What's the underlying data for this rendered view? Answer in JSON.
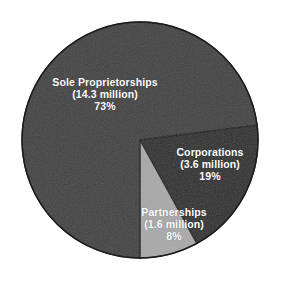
{
  "chart_data": {
    "type": "pie",
    "title": "",
    "subtitle": "",
    "xlabel": "",
    "ylabel": "",
    "legend_position": "none",
    "grid": false,
    "units": "millions of businesses",
    "categories": [
      "Sole Proprietorships",
      "Corporations",
      "Partnerships"
    ],
    "values": [
      73,
      19,
      8
    ],
    "counts": [
      14.3,
      3.6,
      1.6
    ],
    "slices": [
      {
        "name": "Sole Proprietorships",
        "percent": 73,
        "percent_label": "73%",
        "count_label": "(14.3 million)",
        "count": 14.3,
        "color": "#424242",
        "start_angle_deg": 90,
        "end_angle_deg": 352.8
      },
      {
        "name": "Corporations",
        "percent": 19,
        "percent_label": "19%",
        "count_label": "(3.6 million)",
        "count": 3.6,
        "color": "#2e2e2e",
        "start_angle_deg": 0,
        "end_angle_deg": 68.4
      },
      {
        "name": "Partnerships",
        "percent": 8,
        "percent_label": "8%",
        "count_label": "(1.6 million)",
        "count": 1.6,
        "color": "#a9a9a9",
        "start_angle_deg": 68.4,
        "end_angle_deg": 90
      }
    ]
  },
  "labels": {
    "sole": {
      "line1": "Sole Proprietorships",
      "line2": "(14.3 million)",
      "line3": "73%"
    },
    "corporations": {
      "line1": "Corporations",
      "line2": "(3.6 million)",
      "line3": "19%"
    },
    "partnerships": {
      "line1": "Partnerships",
      "line2": "(1.6 million)",
      "line3": "8%"
    }
  },
  "colors": {
    "background": "#ffffff",
    "sole": "#424242",
    "corporations": "#2e2e2e",
    "partnerships": "#a9a9a9",
    "outline": "#1c1c1c",
    "label_text": "#ffffff",
    "shadow": "#e4e4e4"
  }
}
